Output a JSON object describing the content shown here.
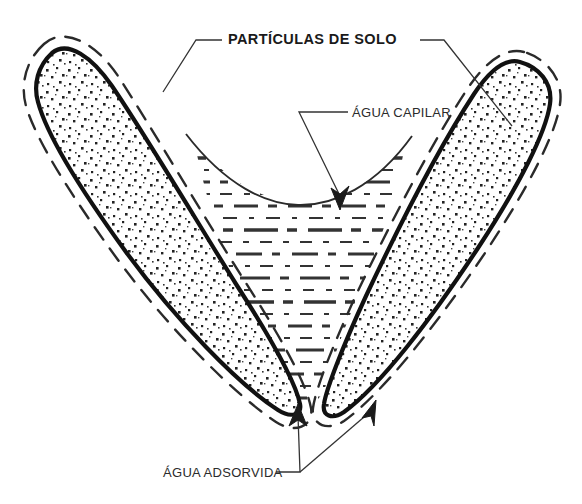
{
  "figure": {
    "title_label": "PARTÍCULAS DE SOLO",
    "capillary_label": "ÁGUA CAPILAR",
    "adsorbed_label": "ÁGUA ADSORVIDA",
    "background_color": "#ffffff",
    "ink_color": "#1a1a1a",
    "stipple_color": "#222222",
    "water_line_color": "#333333"
  },
  "annotations": [
    {
      "id": "particulas-de-solo",
      "text": "PARTÍCULAS DE SOLO",
      "style": "bold",
      "x": 228,
      "y": 44,
      "points_to": [
        "left-soil-particle",
        "right-soil-particle"
      ]
    },
    {
      "id": "agua-capilar",
      "text": "ÁGUA CAPILAR",
      "style": "regular",
      "x": 352,
      "y": 116,
      "points_to": [
        "capillary-water-region"
      ]
    },
    {
      "id": "agua-adsorvida",
      "text": "ÁGUA ADSORVIDA",
      "style": "regular",
      "x": 163,
      "y": 477,
      "points_to": [
        "left-adsorbed-layer",
        "right-adsorbed-layer"
      ]
    }
  ],
  "elements": {
    "left_particle_name": "left-soil-particle",
    "right_particle_name": "right-soil-particle",
    "capillary_region_name": "capillary-water-region",
    "meniscus_name": "meniscus-curve"
  }
}
